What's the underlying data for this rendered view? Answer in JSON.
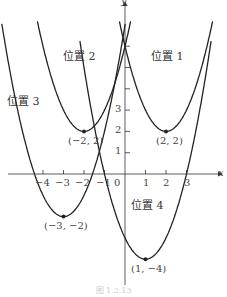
{
  "chart_data": {
    "type": "line",
    "title": "",
    "xlabel": "x",
    "ylabel": "y",
    "xlim": [
      -5.5,
      4.5
    ],
    "ylim": [
      -5.5,
      8
    ],
    "grid": false,
    "x_ticks": [
      "-4",
      "-3",
      "-2",
      "-1",
      "0",
      "1",
      "2",
      "3"
    ],
    "y_ticks": [
      "1",
      "2",
      "3"
    ],
    "series": [
      {
        "name": "位置 1",
        "equation": "y=(x-2)^2+2",
        "vertex": [
          2,
          2
        ],
        "vertex_label": "(2, 2)"
      },
      {
        "name": "位置 2",
        "equation": "y=(x+2)^2+2",
        "vertex": [
          -2,
          2
        ],
        "vertex_label": "(−2, 2)"
      },
      {
        "name": "位置 3",
        "equation": "y=(x+3)^2-2",
        "vertex": [
          -3,
          -2
        ],
        "vertex_label": "(−3, −2)"
      },
      {
        "name": "位置 4",
        "equation": "y=(x-1)^2-4",
        "vertex": [
          1,
          -4
        ],
        "vertex_label": "(1, −4)"
      }
    ]
  },
  "labels": {
    "pos1": "位置 1",
    "pos2": "位置 2",
    "pos3": "位置 3",
    "pos4": "位置 4",
    "v1": "(2, 2)",
    "v2": "(−2, 2)",
    "v3": "(−3, −2)",
    "v4": "(1, −4)",
    "xaxis": "x",
    "yaxis": "y",
    "t_m4": "−4",
    "t_m3": "−3",
    "t_m2": "−2",
    "t_m1": "−1",
    "t_0": "0",
    "t_1": "1",
    "t_2": "2",
    "t_3": "3",
    "ty_1": "1",
    "ty_2": "2",
    "ty_3": "3"
  },
  "caption": "图 1.2.13"
}
